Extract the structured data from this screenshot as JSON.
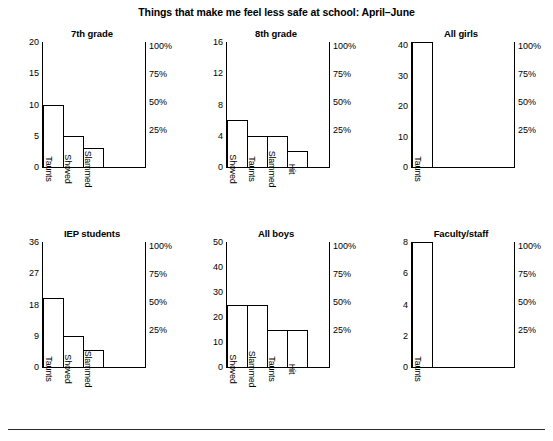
{
  "figure": {
    "title": "Things that make me feel less safe at school: April–June"
  },
  "chart_data": [
    {
      "type": "bar",
      "title": "7th grade",
      "categories": [
        "Taunts",
        "Shoved",
        "Slammed"
      ],
      "values": [
        10,
        5,
        3
      ],
      "xlabel": "",
      "ylabel": "",
      "ylim": [
        0,
        20
      ],
      "yticks": [
        0,
        5,
        10,
        15,
        20
      ],
      "ytick_labels": [
        "0",
        "5",
        "10",
        "15",
        "20"
      ],
      "secondary_axis": {
        "labels": [
          "25%",
          "50%",
          "75%",
          "100%"
        ],
        "values": [
          25,
          50,
          75,
          100
        ],
        "ylim": [
          0,
          100
        ],
        "position": "right"
      },
      "grid": false,
      "legend": "none"
    },
    {
      "type": "bar",
      "title": "8th grade",
      "categories": [
        "Shoved",
        "Taunts",
        "Slammed",
        "Hit"
      ],
      "values": [
        6,
        4,
        4,
        2
      ],
      "xlabel": "",
      "ylabel": "",
      "ylim": [
        0,
        16
      ],
      "yticks": [
        0,
        4,
        8,
        12,
        16
      ],
      "ytick_labels": [
        "0",
        "4",
        "8",
        "12",
        "16"
      ],
      "secondary_axis": {
        "labels": [
          "25%",
          "50%",
          "75%",
          "100%"
        ],
        "values": [
          25,
          50,
          75,
          100
        ],
        "ylim": [
          0,
          100
        ],
        "position": "right"
      },
      "grid": false,
      "legend": "none"
    },
    {
      "type": "bar",
      "title": "All girls",
      "categories": [
        "Taunts"
      ],
      "values": [
        41
      ],
      "xlabel": "",
      "ylabel": "",
      "ylim": [
        0,
        41
      ],
      "yticks": [
        0,
        10,
        20,
        30,
        40
      ],
      "ytick_labels": [
        "0",
        "10",
        "20",
        "30",
        "40"
      ],
      "secondary_axis": {
        "labels": [
          "25%",
          "50%",
          "75%",
          "100%"
        ],
        "values": [
          25,
          50,
          75,
          100
        ],
        "ylim": [
          0,
          100
        ],
        "position": "right"
      },
      "grid": false,
      "legend": "none"
    },
    {
      "type": "bar",
      "title": "IEP students",
      "categories": [
        "Taunts",
        "Shoved",
        "Slammed"
      ],
      "values": [
        20,
        9,
        5
      ],
      "xlabel": "",
      "ylabel": "",
      "ylim": [
        0,
        36
      ],
      "yticks": [
        0,
        9,
        18,
        27,
        36
      ],
      "ytick_labels": [
        "0",
        "9",
        "18",
        "27",
        "36"
      ],
      "secondary_axis": {
        "labels": [
          "25%",
          "50%",
          "75%",
          "100%"
        ],
        "values": [
          25,
          50,
          75,
          100
        ],
        "ylim": [
          0,
          100
        ],
        "position": "right"
      },
      "grid": false,
      "legend": "none"
    },
    {
      "type": "bar",
      "title": "All boys",
      "categories": [
        "Shoved",
        "Slammed",
        "Taunts",
        "Hit"
      ],
      "values": [
        25,
        25,
        15,
        15
      ],
      "xlabel": "",
      "ylabel": "",
      "ylim": [
        0,
        50
      ],
      "yticks": [
        0,
        10,
        20,
        30,
        40,
        50
      ],
      "ytick_labels": [
        "0",
        "10",
        "20",
        "30",
        "40",
        "50"
      ],
      "secondary_axis": {
        "labels": [
          "25%",
          "50%",
          "75%",
          "100%"
        ],
        "values": [
          25,
          50,
          75,
          100
        ],
        "ylim": [
          0,
          100
        ],
        "position": "right"
      },
      "grid": false,
      "legend": "none"
    },
    {
      "type": "bar",
      "title": "Faculty/staff",
      "categories": [
        "Taunts"
      ],
      "values": [
        8
      ],
      "xlabel": "",
      "ylabel": "",
      "ylim": [
        0,
        8
      ],
      "yticks": [
        0,
        2,
        4,
        6,
        8
      ],
      "ytick_labels": [
        "0",
        "2",
        "4",
        "6",
        "8"
      ],
      "secondary_axis": {
        "labels": [
          "25%",
          "50%",
          "75%",
          "100%"
        ],
        "values": [
          25,
          50,
          75,
          100
        ],
        "ylim": [
          0,
          100
        ],
        "position": "right"
      },
      "grid": false,
      "legend": "none"
    }
  ],
  "colors": {
    "bar_fill": "#ffffff",
    "bar_stroke": "#000000",
    "axis": "#000000",
    "text": "#000000",
    "rule": "#2b2b2b"
  }
}
